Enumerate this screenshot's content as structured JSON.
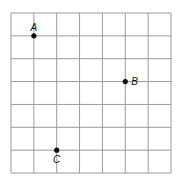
{
  "diagram": {
    "type": "coordinate-grid",
    "columns": 7,
    "rows": 7,
    "grid_color": "#9a9a9a",
    "point_color": "#111111",
    "points": [
      {
        "label": "A",
        "col": 1,
        "row": 1
      },
      {
        "label": "B",
        "col": 5,
        "row": 3
      },
      {
        "label": "C",
        "col": 2,
        "row": 6
      }
    ]
  }
}
